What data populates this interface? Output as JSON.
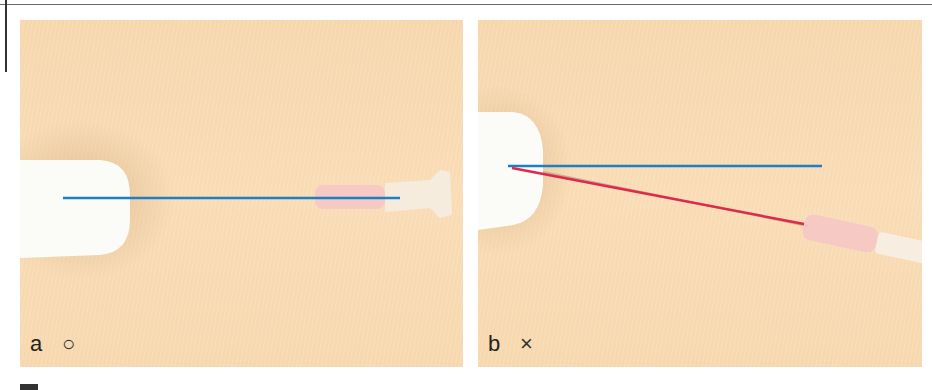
{
  "figure": {
    "panels": [
      {
        "id": "a",
        "label": "a",
        "mark": "○",
        "mark_meaning": "correct",
        "reference_line_color": "#1e7fc4"
      },
      {
        "id": "b",
        "label": "b",
        "mark": "×",
        "mark_meaning": "incorrect",
        "reference_line_color": "#1e7fc4",
        "deviation_line_color": "#e0284a"
      }
    ]
  },
  "colors": {
    "background_skin": "#f8d9b0",
    "device_white": "#ffffff",
    "blue_line": "#1e7fc4",
    "red_line": "#e0284a",
    "hub_pink": "#f6c6c6"
  }
}
